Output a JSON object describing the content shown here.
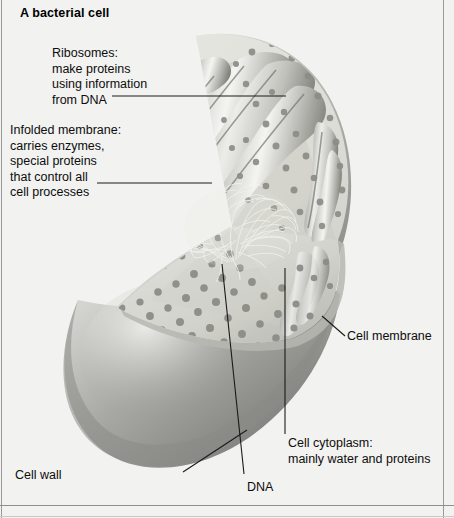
{
  "page": {
    "title": "A bacterial cell",
    "background_color": "#f2f2f0",
    "text_color": "#0d0d0d",
    "frame_color": "#9a9a98"
  },
  "diagram": {
    "colors": {
      "cell_wall": "#8e8e8c",
      "cell_wall_highlight": "#d6d6d4",
      "cut_surface": "#dcdcd8",
      "ribosome_dot": "#8a8a86",
      "membrane_fold": "#c9c9c4",
      "membrane_shadow": "#7c7c78",
      "dna_fiber": "#f0f0ec"
    },
    "features": [
      "infolded membrane ridges",
      "ribosome granules",
      "DNA nucleoid tangle",
      "cell membrane rim",
      "outer cell wall"
    ]
  },
  "labels": [
    {
      "id": "ribosomes",
      "text": "Ribosomes:\nmake proteins\nusing information\nfrom DNA",
      "points_to": "ribosome granules in cytoplasm"
    },
    {
      "id": "infolded-membrane",
      "text": "Infolded membrane:\ncarries enzymes,\nspecial proteins\nthat control all\ncell processes",
      "points_to": "membrane folds"
    },
    {
      "id": "cell-membrane",
      "text": "Cell membrane",
      "points_to": "membrane rim at cut edge"
    },
    {
      "id": "cell-cytoplasm",
      "text": "Cell cytoplasm:\nmainly water and proteins",
      "points_to": "interior cut surface"
    },
    {
      "id": "cell-wall",
      "text": "Cell wall",
      "points_to": "outer surface of cell"
    },
    {
      "id": "dna",
      "text": "DNA",
      "points_to": "nucleoid fiber tangle"
    }
  ]
}
